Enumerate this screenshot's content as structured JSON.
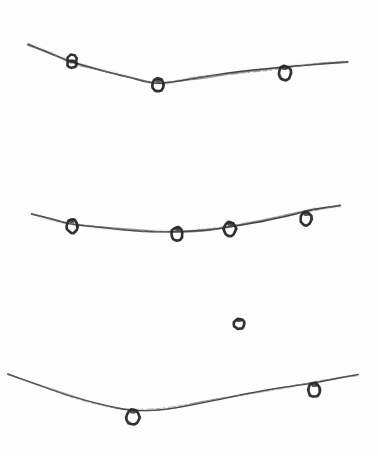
{
  "image": {
    "title": "Hand-drawn sketch of birds perched on sagging wires",
    "width": 378,
    "height": 456,
    "background_color": "#fdfdfd",
    "ink_color": "#2b2b2b",
    "ink_color_light": "#4a4a4a",
    "ink_color_faint": "#7a7a7a",
    "medium": "pencil-on-paper",
    "subject": "three catenary wires with ring-shaped perched figures"
  },
  "chart_data": {
    "type": "line",
    "title": "Hand-drawn sketch of birds perched on sagging wires",
    "xlabel": "",
    "ylabel": "",
    "xlim": [
      0,
      378
    ],
    "ylim": [
      456,
      0
    ],
    "grid": false,
    "legend": "none",
    "series": [
      {
        "name": "wire-top",
        "stroke_width": 1.6,
        "points": [
          [
            28,
            44
          ],
          [
            48,
            52
          ],
          [
            72,
            62
          ],
          [
            100,
            70
          ],
          [
            128,
            77
          ],
          [
            158,
            83
          ],
          [
            196,
            78
          ],
          [
            240,
            72
          ],
          [
            286,
            67
          ],
          [
            320,
            64
          ],
          [
            348,
            62
          ]
        ],
        "markers": [
          {
            "x": 72,
            "y": 61,
            "rx": 5.0,
            "ry": 7.0,
            "shape": "double-ring",
            "label": "perched-figure-1"
          },
          {
            "x": 158,
            "y": 85,
            "rx": 6.0,
            "ry": 6.5,
            "shape": "ring",
            "label": "perched-figure-2"
          },
          {
            "x": 285,
            "y": 73,
            "rx": 6.0,
            "ry": 7.0,
            "shape": "ring",
            "label": "perched-figure-3"
          }
        ]
      },
      {
        "name": "wire-middle",
        "stroke_width": 1.6,
        "points": [
          [
            32,
            214
          ],
          [
            54,
            220
          ],
          [
            72,
            224
          ],
          [
            104,
            228
          ],
          [
            140,
            231
          ],
          [
            177,
            232
          ],
          [
            206,
            230
          ],
          [
            230,
            227
          ],
          [
            262,
            221
          ],
          [
            290,
            215
          ],
          [
            312,
            210
          ],
          [
            340,
            206
          ]
        ],
        "markers": [
          {
            "x": 72,
            "y": 226,
            "rx": 5.5,
            "ry": 7.0,
            "shape": "ring",
            "label": "perched-figure-4"
          },
          {
            "x": 177,
            "y": 234,
            "rx": 5.5,
            "ry": 7.0,
            "shape": "ring",
            "label": "perched-figure-5"
          },
          {
            "x": 230,
            "y": 229,
            "rx": 6.0,
            "ry": 7.0,
            "shape": "ring",
            "label": "perched-figure-6"
          },
          {
            "x": 306,
            "y": 219,
            "rx": 5.5,
            "ry": 7.0,
            "shape": "ring",
            "label": "perched-figure-7"
          }
        ]
      },
      {
        "name": "wire-bottom",
        "stroke_width": 1.3,
        "points": [
          [
            8,
            374
          ],
          [
            36,
            384
          ],
          [
            70,
            396
          ],
          [
            104,
            405
          ],
          [
            133,
            410
          ],
          [
            166,
            409
          ],
          [
            206,
            402
          ],
          [
            248,
            394
          ],
          [
            286,
            387
          ],
          [
            314,
            383
          ],
          [
            340,
            378
          ],
          [
            358,
            375
          ]
        ],
        "markers": [
          {
            "x": 133,
            "y": 417,
            "rx": 6.5,
            "ry": 7.5,
            "shape": "ring",
            "label": "perched-figure-8"
          },
          {
            "x": 314,
            "y": 390,
            "rx": 6.0,
            "ry": 7.0,
            "shape": "ring",
            "label": "perched-figure-9"
          }
        ]
      },
      {
        "name": "floating-figure",
        "stroke_width": 0,
        "points": [],
        "markers": [
          {
            "x": 239,
            "y": 324,
            "rx": 5.5,
            "ry": 5.0,
            "shape": "ring",
            "label": "floating-figure-1"
          }
        ]
      }
    ],
    "annotations": [],
    "counts": {
      "wires": 3,
      "figures_on_top_wire": 3,
      "figures_on_middle_wire": 4,
      "figures_on_bottom_wire": 2,
      "floating_figures": 1,
      "figures_total": 10
    }
  }
}
